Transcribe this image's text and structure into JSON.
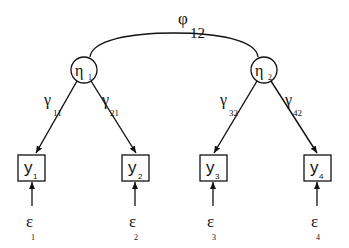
{
  "diagram": {
    "type": "structural-equation-model",
    "covariance": {
      "symbol": "φ",
      "subscript": "12"
    },
    "latents": [
      {
        "id": "eta1",
        "symbol": "η",
        "subscript": "1",
        "cx": 84,
        "cy": 70
      },
      {
        "id": "eta2",
        "symbol": "η",
        "subscript": "2",
        "cx": 264,
        "cy": 70
      }
    ],
    "loadings": [
      {
        "symbol": "γ",
        "subscript": "11"
      },
      {
        "symbol": "γ",
        "subscript": "21"
      },
      {
        "symbol": "γ",
        "subscript": "32"
      },
      {
        "symbol": "γ",
        "subscript": "42"
      }
    ],
    "indicators": [
      {
        "symbol": "y",
        "subscript": "1"
      },
      {
        "symbol": "y",
        "subscript": "2"
      },
      {
        "symbol": "y",
        "subscript": "3"
      },
      {
        "symbol": "y",
        "subscript": "4"
      }
    ],
    "errors": [
      {
        "symbol": "ε",
        "subscript": "1"
      },
      {
        "symbol": "ε",
        "subscript": "2"
      },
      {
        "symbol": "ε",
        "subscript": "3"
      },
      {
        "symbol": "ε",
        "subscript": "4"
      }
    ]
  }
}
